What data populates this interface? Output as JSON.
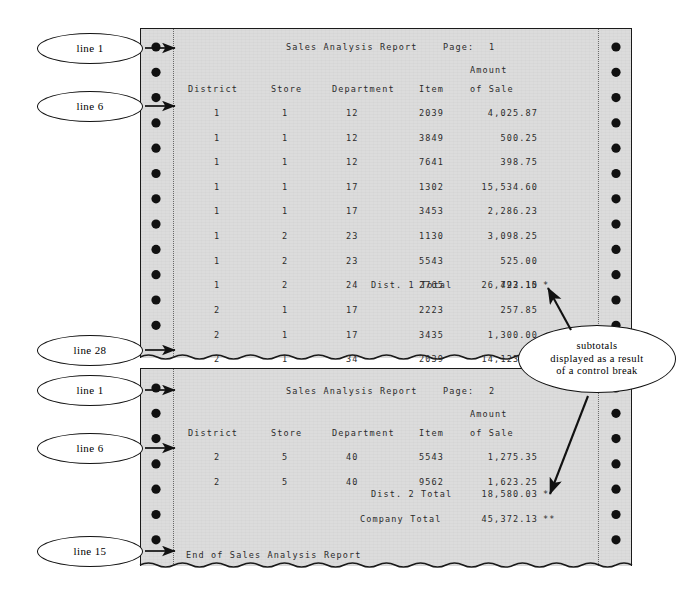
{
  "figure": {
    "paper_color": "#dcdcdc",
    "ink_color": "#2b2b2b"
  },
  "callouts": {
    "line_1_top": "line 1",
    "line_6_top": "line 6",
    "line_28": "line 28",
    "line_1_bottom": "line 1",
    "line_6_bottom": "line 6",
    "line_15": "line 15",
    "subtotals_line1": "subtotals",
    "subtotals_line2": "displayed as a result",
    "subtotals_line3": "of a control break"
  },
  "page1": {
    "title": "Sales Analysis Report",
    "page_label": "Page:",
    "page_number": "1",
    "headers": {
      "district": "District",
      "store": "Store",
      "department": "Department",
      "item": "Item",
      "amount_line1": "Amount",
      "amount_line2": "of Sale"
    },
    "rows": [
      {
        "district": "1",
        "store": "1",
        "department": "12",
        "item": "2039",
        "amount": "4,025.87"
      },
      {
        "district": "1",
        "store": "1",
        "department": "12",
        "item": "3849",
        "amount": "500.25"
      },
      {
        "district": "1",
        "store": "1",
        "department": "12",
        "item": "7641",
        "amount": "398.75"
      },
      {
        "district": "1",
        "store": "1",
        "department": "17",
        "item": "1302",
        "amount": "15,534.60"
      },
      {
        "district": "1",
        "store": "1",
        "department": "17",
        "item": "3453",
        "amount": "2,286.23"
      },
      {
        "district": "1",
        "store": "2",
        "department": "23",
        "item": "1130",
        "amount": "3,098.25"
      },
      {
        "district": "1",
        "store": "2",
        "department": "23",
        "item": "5543",
        "amount": "525.00"
      },
      {
        "district": "1",
        "store": "2",
        "department": "24",
        "item": "2765",
        "amount": "423.15"
      }
    ],
    "subtotal": {
      "label_left": "Dist. 1",
      "label_right": "Total",
      "amount": "26,792.10",
      "marker": "*"
    },
    "rows_after": [
      {
        "district": "2",
        "store": "1",
        "department": "17",
        "item": "2223",
        "amount": "257.85"
      },
      {
        "district": "2",
        "store": "1",
        "department": "17",
        "item": "3435",
        "amount": "1,300.00"
      },
      {
        "district": "2",
        "store": "1",
        "department": "34",
        "item": "2039",
        "amount": "14,123.58"
      }
    ]
  },
  "page2": {
    "title": "Sales Analysis Report",
    "page_label": "Page:",
    "page_number": "2",
    "headers": {
      "district": "District",
      "store": "Store",
      "department": "Department",
      "item": "Item",
      "amount_line1": "Amount",
      "amount_line2": "of Sale"
    },
    "rows": [
      {
        "district": "2",
        "store": "5",
        "department": "40",
        "item": "5543",
        "amount": "1,275.35"
      },
      {
        "district": "2",
        "store": "5",
        "department": "40",
        "item": "9562",
        "amount": "1,623.25"
      }
    ],
    "subtotal": {
      "label_left": "Dist. 2",
      "label_right": "Total",
      "amount": "18,580.03",
      "marker": "*"
    },
    "grand_total": {
      "label": "Company Total",
      "amount": "45,372.13",
      "marker": "**"
    },
    "footer": "End of Sales Analysis Report"
  }
}
